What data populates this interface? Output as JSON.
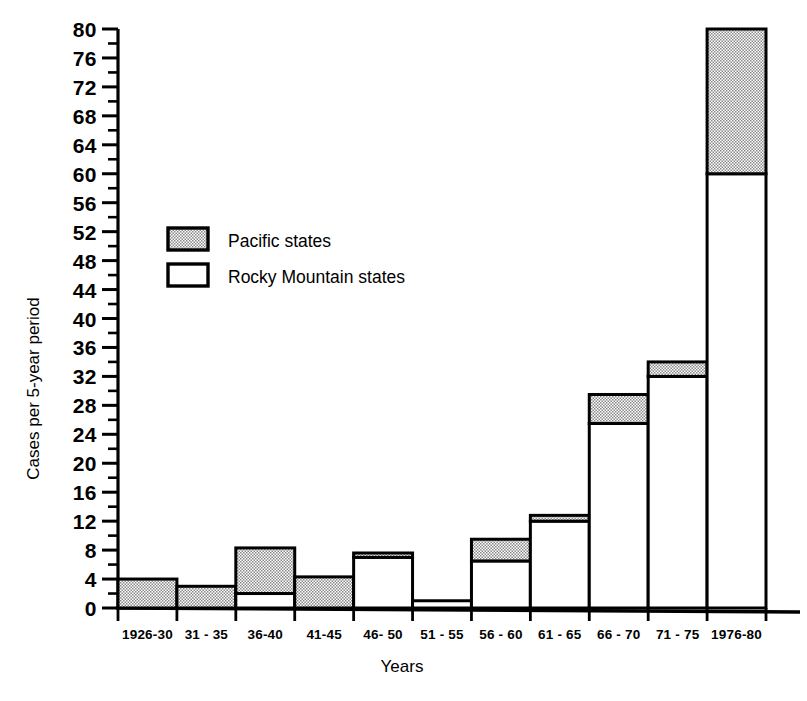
{
  "chart_data": {
    "type": "bar",
    "subtype": "stacked-bar",
    "title": "",
    "xlabel": "Years",
    "ylabel": "Cases per 5-year period",
    "categories": [
      "1926-30",
      "31 - 35",
      "36-40",
      "41-45",
      "46- 50",
      "51 - 55",
      "56 - 60",
      "61 - 65",
      "66 - 70",
      "71 - 75",
      "1976-80"
    ],
    "series": [
      {
        "name": "Rocky Mountain states",
        "fill": "white",
        "values": [
          0,
          0,
          2,
          0,
          7,
          1,
          6.5,
          12,
          25.5,
          32,
          60
        ]
      },
      {
        "name": "Pacific states",
        "fill": "stipple",
        "values": [
          4,
          3,
          6.3,
          4.3,
          0.6,
          0,
          3,
          0.8,
          4,
          2,
          20
        ]
      }
    ],
    "totals": [
      4,
      3,
      8.3,
      4.3,
      7.6,
      1,
      9.5,
      12.8,
      29.5,
      34,
      80
    ],
    "ylim": [
      0,
      80
    ],
    "ytick_step": 4,
    "yminor_step": 2,
    "ytick_labels": [
      "0",
      "4",
      "8",
      "12",
      "16",
      "20",
      "24",
      "28",
      "32",
      "36",
      "40",
      "44",
      "48",
      "52",
      "56",
      "60",
      "64",
      "68",
      "72",
      "76",
      "80"
    ],
    "grid": false,
    "legend_position": "upper-left-inside",
    "legend": [
      {
        "label": "Pacific states",
        "swatch": "stipple"
      },
      {
        "label": "Rocky Mountain states",
        "swatch": "white"
      }
    ]
  },
  "colors": {
    "ink": "#000000",
    "background": "#ffffff",
    "stipple_fill": "#cccccc"
  }
}
